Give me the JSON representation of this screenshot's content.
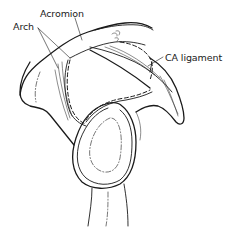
{
  "diagram": {
    "labels": {
      "acromion": "Acromion",
      "arch": "Arch",
      "ca_ligament": "CA ligament"
    },
    "colors": {
      "ink": "#1a1a1a",
      "background": "#ffffff"
    }
  }
}
